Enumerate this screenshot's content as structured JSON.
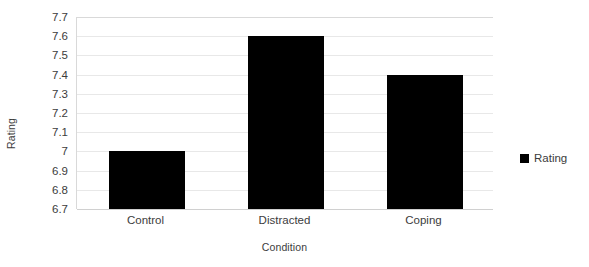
{
  "chart_data": {
    "type": "bar",
    "title": "",
    "subtitle": "",
    "categories": [
      "Control",
      "Distracted",
      "Coping"
    ],
    "values": [
      7.0,
      7.6,
      7.4
    ],
    "series": [
      {
        "name": "Rating",
        "values": [
          7.0,
          7.6,
          7.4
        ],
        "color": "#000000"
      }
    ],
    "xlabel": "Condition",
    "ylabel": "Rating",
    "ylim": [
      6.7,
      7.7
    ],
    "ytick_step": 0.1,
    "ytick_labels": [
      "7.7",
      "7.6",
      "7.5",
      "7.4",
      "7.3",
      "7.2",
      "7.1",
      "7",
      "6.9",
      "6.8",
      "6.7"
    ],
    "ytick_values": [
      7.7,
      7.6,
      7.5,
      7.4,
      7.3,
      7.2,
      7.1,
      7.0,
      6.9,
      6.8,
      6.7
    ],
    "grid": true,
    "grid_axis": "y",
    "legend": {
      "position": "right",
      "entries": [
        "Rating"
      ]
    },
    "bar_color": "#000000",
    "grid_color": "#e8e8e8",
    "axis_color": "#d9d9d9",
    "text_color": "#3c3c3c",
    "background": "#ffffff"
  }
}
